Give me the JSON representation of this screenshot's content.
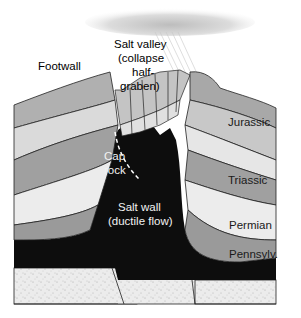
{
  "diagram": {
    "labels": {
      "footwall": "Footwall",
      "salt_valley": [
        "Salt valley",
        "(collapse",
        "half-",
        "graben)"
      ],
      "cap_rock": [
        "Cap",
        "rock"
      ],
      "salt_wall": [
        "Salt wall",
        "(ductile flow)"
      ],
      "jurassic": "Jurassic",
      "triassic": "Triassic",
      "permian": "Permian",
      "pennsylv": "Pennsylv."
    },
    "colors": {
      "salt": "#0d0d0d",
      "layer_dark": "#9a9a9a",
      "layer_mid": "#b5b5b5",
      "layer_light": "#dcdcdc",
      "basement": "#ebebeb",
      "outline": "#222222",
      "cloud": "#cfcfcf"
    }
  }
}
